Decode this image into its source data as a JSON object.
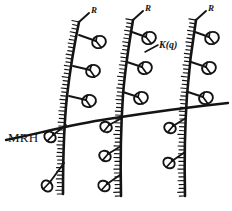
{
  "figure": {
    "type": "line-diagram",
    "background_color": "#ffffff",
    "ink_color": "#141414",
    "width": 232,
    "height": 211
  },
  "labels": {
    "mrh": "MRH",
    "kq": "K(q)",
    "r_first": "R",
    "r_second": "R",
    "r_third": "R"
  },
  "diagram_data": {
    "horizontal_line_label": "MRH",
    "appendage_label": "K(q)",
    "axis_tip_label": "R",
    "stem_count": 3,
    "stems": [
      {
        "name": "stem-1",
        "path": "M79,22 C74,46 70,70 67,96 C64,124 63,152 63,194",
        "hatch_side": "left",
        "hatch_count": 46,
        "appendages_above": 3,
        "appendages_below": 2
      },
      {
        "name": "stem-2",
        "path": "M133,20 C129,44 125,68 123,95 C121,124 120,152 121,196",
        "hatch_side": "left",
        "hatch_count": 46,
        "appendages_above": 3,
        "appendages_below": 3
      },
      {
        "name": "stem-3",
        "path": "M196,20 C192,44 189,68 187,95 C185,124 184,152 185,196",
        "hatch_side": "left",
        "hatch_count": 46,
        "appendages_above": 3,
        "appendages_below": 2
      }
    ],
    "mrh_line_path": "M6,140 C40,133 74,124 108,119 C146,113 190,107 228,103",
    "appendages_above_line": [
      {
        "stem": 1,
        "stalk": "M79,35 L96,41",
        "cup_cx": 99,
        "cup_cy": 42,
        "cup_rx": 7,
        "cup_ry": 6,
        "cup_rot": -22,
        "direction": "right"
      },
      {
        "stem": 1,
        "stalk": "M73,66 L90,70",
        "cup_cx": 93,
        "cup_cy": 71,
        "cup_rx": 7,
        "cup_ry": 6,
        "cup_rot": -16,
        "direction": "right"
      },
      {
        "stem": 1,
        "stalk": "M69,96 L86,100",
        "cup_cx": 89,
        "cup_cy": 101,
        "cup_rx": 7,
        "cup_ry": 6,
        "cup_rot": -16,
        "direction": "right"
      },
      {
        "stem": 2,
        "stalk": "M132,32 L146,37",
        "cup_cx": 149,
        "cup_cy": 38,
        "cup_rx": 7,
        "cup_ry": 6,
        "cup_rot": -22,
        "direction": "right"
      },
      {
        "stem": 2,
        "stalk": "M127,62 L142,67",
        "cup_cx": 145,
        "cup_cy": 68,
        "cup_rx": 7,
        "cup_ry": 6,
        "cup_rot": -18,
        "direction": "right"
      },
      {
        "stem": 2,
        "stalk": "M123,92 L138,97",
        "cup_cx": 141,
        "cup_cy": 98,
        "cup_rx": 7,
        "cup_ry": 6,
        "cup_rot": -18,
        "direction": "right"
      },
      {
        "stem": 3,
        "stalk": "M195,32 L209,37",
        "cup_cx": 212,
        "cup_cy": 38,
        "cup_rx": 7,
        "cup_ry": 6,
        "cup_rot": -22,
        "direction": "right"
      },
      {
        "stem": 3,
        "stalk": "M191,62 L206,67",
        "cup_cx": 209,
        "cup_cy": 68,
        "cup_rx": 7,
        "cup_ry": 6,
        "cup_rot": -18,
        "direction": "right"
      },
      {
        "stem": 3,
        "stalk": "M188,92 L203,97",
        "cup_cx": 206,
        "cup_cy": 98,
        "cup_rx": 7,
        "cup_ry": 6,
        "cup_rot": -18,
        "direction": "right"
      }
    ],
    "appendages_below_line": [
      {
        "stem": 1,
        "stalk": "M66,125 L53,135",
        "cup_cx": 50,
        "cup_cy": 137,
        "cup_rx": 6,
        "cup_ry": 5,
        "cup_rot": 34,
        "direction": "left"
      },
      {
        "stem": 1,
        "stalk": "M64,163 L50,182",
        "cup_cx": 47,
        "cup_cy": 186,
        "cup_rx": 6,
        "cup_ry": 5,
        "cup_rot": 50,
        "direction": "left"
      },
      {
        "stem": 2,
        "stalk": "M122,118 L109,125",
        "cup_cx": 106,
        "cup_cy": 127,
        "cup_rx": 6,
        "cup_ry": 5,
        "cup_rot": 26,
        "direction": "left"
      },
      {
        "stem": 2,
        "stalk": "M121,146 L108,154",
        "cup_cx": 105,
        "cup_cy": 156,
        "cup_rx": 6,
        "cup_ry": 5,
        "cup_rot": 30,
        "direction": "left"
      },
      {
        "stem": 2,
        "stalk": "M120,175 L107,184",
        "cup_cx": 104,
        "cup_cy": 186,
        "cup_rx": 6,
        "cup_ry": 5,
        "cup_rot": 32,
        "direction": "left"
      },
      {
        "stem": 3,
        "stalk": "M186,118 L173,126",
        "cup_cx": 170,
        "cup_cy": 128,
        "cup_rx": 6,
        "cup_ry": 5,
        "cup_rot": 28,
        "direction": "left"
      },
      {
        "stem": 3,
        "stalk": "M185,152 L172,161",
        "cup_cx": 169,
        "cup_cy": 163,
        "cup_rx": 6,
        "cup_ry": 5,
        "cup_rot": 32,
        "direction": "left"
      }
    ],
    "tip_marks": [
      {
        "stem": 1,
        "stalk": "M79,22 L89,13",
        "label_x": 91,
        "label_y": 13
      },
      {
        "stem": 2,
        "stalk": "M133,20 L143,11",
        "label_x": 145,
        "label_y": 11
      },
      {
        "stem": 3,
        "stalk": "M196,20 L206,11",
        "label_x": 208,
        "label_y": 11
      }
    ],
    "kq_leader": "M145,52 L158,45",
    "kq_label_x": 159,
    "kq_label_y": 48,
    "mrh_label_x": 8,
    "mrh_label_y": 142
  }
}
